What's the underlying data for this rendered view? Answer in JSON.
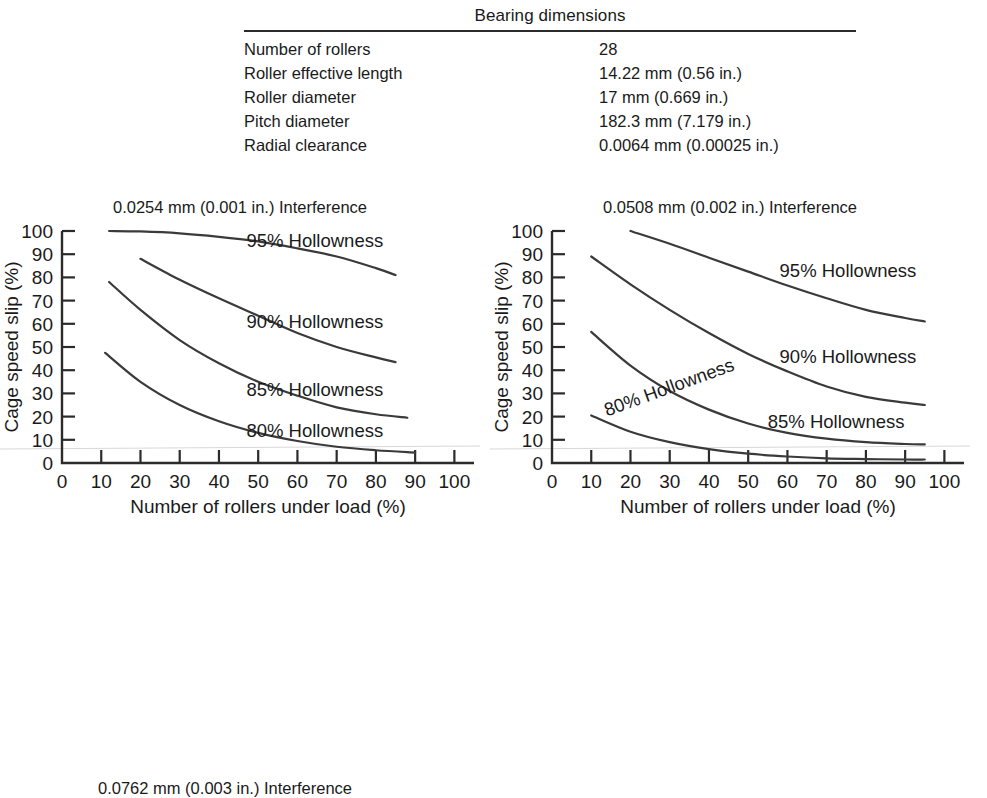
{
  "table": {
    "title": "Bearing dimensions",
    "rows": [
      {
        "label": "Number of rollers",
        "value": "28"
      },
      {
        "label": "Roller effective length",
        "value": "14.22 mm (0.56 in.)"
      },
      {
        "label": "Roller diameter",
        "value": "17 mm (0.669 in.)"
      },
      {
        "label": "Pitch diameter",
        "value": "182.3 mm (7.179 in.)"
      },
      {
        "label": "Radial clearance",
        "value": "0.0064 mm (0.00025 in.)"
      }
    ]
  },
  "bottom_caption": "0.0762 mm (0.003 in.) Interference",
  "axes": {
    "xlabel": "Number of rollers under load (%)",
    "ylabel": "Cage speed slip (%)",
    "xticks": [
      "0",
      "10",
      "20",
      "30",
      "40",
      "50",
      "60",
      "70",
      "80",
      "90",
      "100"
    ],
    "yticks": [
      "0",
      "10",
      "20",
      "30",
      "40",
      "50",
      "60",
      "70",
      "80",
      "90",
      "100"
    ]
  },
  "chart_data": [
    {
      "type": "line",
      "title": "0.0254 mm (0.001 in.) Interference",
      "xlabel": "Number of rollers under load (%)",
      "ylabel": "Cage speed slip (%)",
      "xlim": [
        0,
        105
      ],
      "ylim": [
        0,
        100
      ],
      "grid": false,
      "legend_position": "inline-annotations",
      "series": [
        {
          "name": "95% Hollowness",
          "label": "95% Hollowness",
          "x": [
            12,
            20,
            30,
            40,
            50,
            60,
            70,
            80,
            85
          ],
          "y": [
            100,
            99.8,
            99,
            97.5,
            95.5,
            92.5,
            89,
            84,
            81
          ]
        },
        {
          "name": "90% Hollowness",
          "label": "90% Hollowness",
          "x": [
            20,
            30,
            40,
            50,
            60,
            70,
            80,
            85
          ],
          "y": [
            88,
            79,
            71,
            63.5,
            56,
            50,
            45.5,
            43.5
          ]
        },
        {
          "name": "85% Hollowness",
          "label": "85% Hollowness",
          "x": [
            12,
            20,
            30,
            40,
            50,
            60,
            70,
            80,
            88
          ],
          "y": [
            78,
            66,
            53,
            43,
            35,
            29,
            24,
            21,
            19.5
          ]
        },
        {
          "name": "80% Hollowness",
          "label": "80% Hollowness",
          "x": [
            11,
            20,
            30,
            40,
            50,
            60,
            70,
            80,
            90
          ],
          "y": [
            47.5,
            35,
            25,
            18,
            13,
            9.5,
            7,
            5.5,
            4.5
          ]
        }
      ]
    },
    {
      "type": "line",
      "title": "0.0508 mm (0.002 in.) Interference",
      "xlabel": "Number of rollers under load (%)",
      "ylabel": "Cage speed slip (%)",
      "xlim": [
        0,
        105
      ],
      "ylim": [
        0,
        100
      ],
      "grid": false,
      "legend_position": "inline-annotations",
      "series": [
        {
          "name": "95% Hollowness",
          "label": "95% Hollowness",
          "x": [
            20,
            30,
            40,
            50,
            60,
            70,
            80,
            90,
            95
          ],
          "y": [
            100,
            94.5,
            88.5,
            82.5,
            76.5,
            71,
            66,
            62.5,
            61
          ]
        },
        {
          "name": "90% Hollowness",
          "label": "90% Hollowness",
          "x": [
            10,
            20,
            30,
            40,
            50,
            60,
            70,
            80,
            90,
            95
          ],
          "y": [
            89,
            77,
            66,
            56,
            47,
            39.5,
            33,
            28.5,
            26,
            25
          ]
        },
        {
          "name": "85% Hollowness",
          "label": "85% Hollowness",
          "x": [
            10,
            20,
            30,
            40,
            50,
            60,
            70,
            80,
            90,
            95
          ],
          "y": [
            56.5,
            42,
            31,
            23,
            17,
            13,
            10.5,
            9,
            8.2,
            8
          ]
        },
        {
          "name": "80% Hollowness",
          "label": "80% Hollowness",
          "x": [
            10,
            20,
            30,
            40,
            50,
            60,
            70,
            80,
            90,
            95
          ],
          "y": [
            20.5,
            13.5,
            9,
            6,
            4,
            2.8,
            2,
            1.7,
            1.5,
            1.5
          ]
        }
      ]
    }
  ]
}
